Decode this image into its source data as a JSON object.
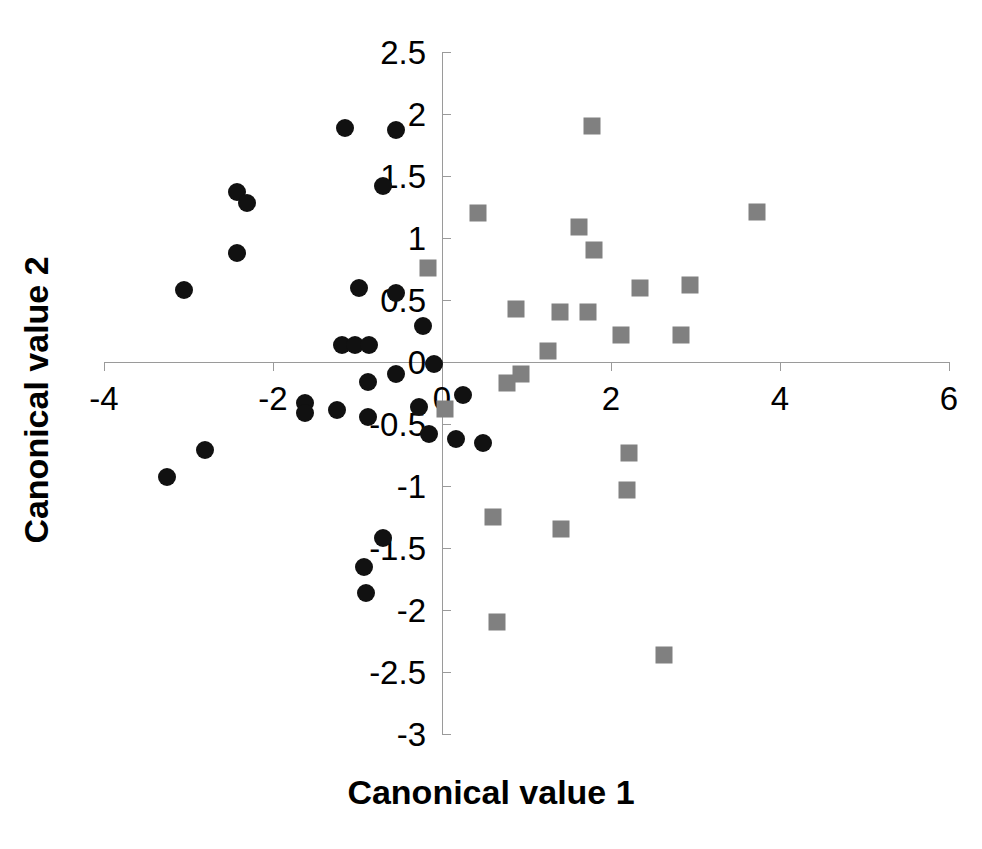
{
  "chart_data": {
    "type": "scatter",
    "title": "",
    "xlabel": "Canonical value 1",
    "ylabel": "Canonical value 2",
    "xlim": [
      -4.0,
      6.0
    ],
    "ylim": [
      -3.0,
      2.5
    ],
    "xticks": [
      -4,
      -2,
      0,
      2,
      4,
      6
    ],
    "xtick_labels": [
      "-4",
      "-2",
      "0",
      "2",
      "4",
      "6"
    ],
    "yticks": [
      2.5,
      2,
      1.5,
      1,
      0.5,
      0,
      -0.5,
      -1,
      -1.5,
      -2,
      -2.5,
      -3
    ],
    "ytick_labels": [
      "2.5",
      "2",
      "1.5",
      "1",
      "0.5",
      "0",
      "-0.5",
      "-1",
      "-1.5",
      "-2",
      "-2.5",
      "-3"
    ],
    "grid": false,
    "legend": "none",
    "axis_color": "#9a9a9a",
    "series": [
      {
        "name": "group-a",
        "marker": "circle",
        "color": "#111111",
        "points": [
          [
            -1.15,
            1.89
          ],
          [
            -0.55,
            1.87
          ],
          [
            -2.43,
            1.37
          ],
          [
            -2.31,
            1.28
          ],
          [
            -0.7,
            1.42
          ],
          [
            -2.43,
            0.88
          ],
          [
            -3.05,
            0.58
          ],
          [
            -0.98,
            0.6
          ],
          [
            -0.55,
            0.56
          ],
          [
            -0.22,
            0.29
          ],
          [
            -1.18,
            0.14
          ],
          [
            -1.03,
            0.14
          ],
          [
            -0.86,
            0.14
          ],
          [
            -0.09,
            -0.02
          ],
          [
            -0.88,
            -0.16
          ],
          [
            -0.55,
            -0.1
          ],
          [
            -1.62,
            -0.33
          ],
          [
            -1.62,
            -0.41
          ],
          [
            -1.24,
            -0.39
          ],
          [
            -0.88,
            -0.44
          ],
          [
            -0.27,
            -0.36
          ],
          [
            0.25,
            -0.27
          ],
          [
            0.16,
            -0.62
          ],
          [
            0.49,
            -0.65
          ],
          [
            -0.15,
            -0.58
          ],
          [
            -2.8,
            -0.71
          ],
          [
            -3.25,
            -0.93
          ],
          [
            -0.7,
            -1.42
          ],
          [
            -0.92,
            -1.65
          ],
          [
            -0.9,
            -1.86
          ]
        ]
      },
      {
        "name": "group-b",
        "marker": "square",
        "color": "#808080",
        "points": [
          [
            1.78,
            1.9
          ],
          [
            3.73,
            1.21
          ],
          [
            0.43,
            1.2
          ],
          [
            1.62,
            1.09
          ],
          [
            1.8,
            0.9
          ],
          [
            -0.17,
            0.76
          ],
          [
            2.34,
            0.6
          ],
          [
            2.94,
            0.62
          ],
          [
            0.88,
            0.43
          ],
          [
            1.4,
            0.4
          ],
          [
            1.73,
            0.4
          ],
          [
            2.12,
            0.22
          ],
          [
            2.83,
            0.22
          ],
          [
            1.25,
            0.09
          ],
          [
            0.77,
            -0.17
          ],
          [
            0.94,
            -0.1
          ],
          [
            0.03,
            -0.38
          ],
          [
            2.21,
            -0.73
          ],
          [
            2.19,
            -1.03
          ],
          [
            0.6,
            -1.25
          ],
          [
            1.41,
            -1.35
          ],
          [
            0.65,
            -2.1
          ],
          [
            2.63,
            -2.36
          ]
        ]
      }
    ]
  },
  "axes": {
    "x_title": "Canonical value 1",
    "y_title": "Canonical value 2"
  }
}
